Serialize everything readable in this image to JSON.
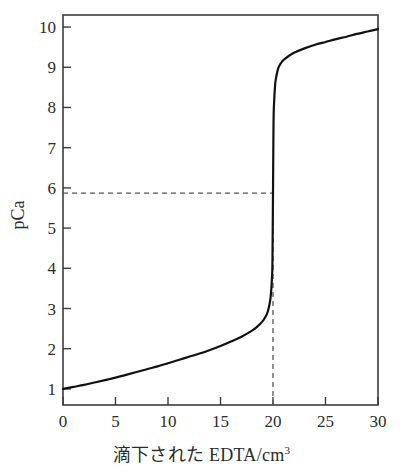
{
  "figure": {
    "background_color": "#ffffff",
    "frame_color": "#3c3c3c",
    "curve_color": "#111111",
    "guide_color": "#555555"
  },
  "axes": {
    "y_title": "pCa",
    "x_title_main": "滴下された EDTA/cm",
    "x_title_sup": "3",
    "x_tick_labels": [
      "0",
      "5",
      "10",
      "15",
      "20",
      "25",
      "30"
    ],
    "y_tick_labels": [
      "1",
      "2",
      "3",
      "4",
      "5",
      "6",
      "7",
      "8",
      "9",
      "10"
    ]
  },
  "chart_data": {
    "type": "line",
    "title": "",
    "xlabel": "滴下された EDTA/cm3",
    "ylabel": "pCa",
    "xlim": [
      0,
      30
    ],
    "ylim": [
      0.6,
      10.3
    ],
    "xticks": [
      0,
      5,
      10,
      15,
      20,
      25,
      30
    ],
    "yticks": [
      1,
      2,
      3,
      4,
      5,
      6,
      7,
      8,
      9,
      10
    ],
    "grid": false,
    "legend": "none",
    "series": [
      {
        "name": "titration-curve",
        "x": [
          0,
          1,
          2,
          3,
          4,
          5,
          6,
          7,
          8,
          9,
          10,
          11,
          12,
          13,
          14,
          15,
          16,
          17,
          18,
          18.5,
          19,
          19.3,
          19.5,
          19.7,
          19.8,
          19.9,
          19.95,
          20,
          20.05,
          20.1,
          20.2,
          20.3,
          20.5,
          20.7,
          21,
          21.5,
          22,
          23,
          24,
          25,
          26,
          27,
          28,
          29,
          30
        ],
        "y": [
          1.0,
          1.05,
          1.1,
          1.16,
          1.22,
          1.28,
          1.35,
          1.42,
          1.49,
          1.56,
          1.64,
          1.72,
          1.8,
          1.88,
          1.97,
          2.07,
          2.18,
          2.3,
          2.45,
          2.55,
          2.68,
          2.8,
          2.92,
          3.15,
          3.35,
          3.75,
          4.2,
          5.87,
          7.6,
          8.1,
          8.55,
          8.75,
          8.98,
          9.08,
          9.18,
          9.28,
          9.36,
          9.47,
          9.56,
          9.63,
          9.7,
          9.76,
          9.83,
          9.89,
          9.95
        ]
      }
    ],
    "annotations": [
      {
        "name": "equivalence-horizontal-guide",
        "type": "dashed-horizontal",
        "y": 5.87,
        "x_from": 0,
        "x_to": 20
      },
      {
        "name": "equivalence-vertical-guide",
        "type": "dashed-vertical",
        "x": 20,
        "y_from": 0.6,
        "y_to": 5.87
      }
    ]
  }
}
